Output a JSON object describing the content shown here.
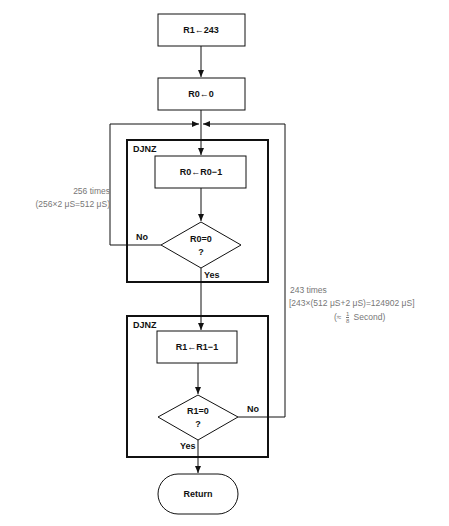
{
  "diagram": {
    "type": "flowchart",
    "nodes": {
      "init_r1": "R1←243",
      "init_r0": "R0←0",
      "dec_r0": "R0←R0−1",
      "test_r0_line1": "R0=0",
      "test_r0_line2": "?",
      "dec_r1": "R1←R1−1",
      "test_r1_line1": "R1=0",
      "test_r1_line2": "?",
      "return": "Return"
    },
    "groups": {
      "inner_loop_label": "DJNZ",
      "outer_loop_label": "DJNZ"
    },
    "edges": {
      "inner_no": "No",
      "inner_yes": "Yes",
      "outer_no": "No",
      "outer_yes": "Yes"
    },
    "annotations": {
      "inner_count": "256 times",
      "inner_timing": "(256×2 μS=512 μS)",
      "outer_count": "243 times",
      "outer_timing": "[243×(512 μS+2 μS)=124902 μS]",
      "outer_approx_prefix": "(≈",
      "outer_approx_num": "1",
      "outer_approx_den": "8",
      "outer_approx_suffix": "Second)"
    }
  }
}
